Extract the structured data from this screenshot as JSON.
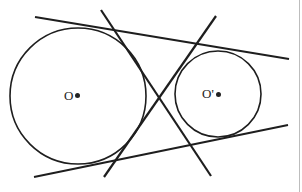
{
  "diagram": {
    "type": "geometry",
    "stroke_color": "#1e1e1e",
    "circles": [
      {
        "id": "O",
        "label": "O",
        "cx": 78,
        "cy": 96,
        "r": 68
      },
      {
        "id": "O_prime",
        "label": "O'",
        "cx": 218,
        "cy": 94,
        "r": 43
      }
    ],
    "tangent_lines": [
      {
        "id": "external-top",
        "x1": 35,
        "y1": 17,
        "x2": 289,
        "y2": 59
      },
      {
        "id": "external-bottom",
        "x1": 34,
        "y1": 177,
        "x2": 288,
        "y2": 125
      },
      {
        "id": "internal-1",
        "x1": 101,
        "y1": 10,
        "x2": 211,
        "y2": 176
      },
      {
        "id": "internal-2",
        "x1": 216,
        "y1": 16,
        "x2": 104,
        "y2": 177
      }
    ],
    "labels": {
      "center_big": "O",
      "center_small": "O'"
    }
  }
}
